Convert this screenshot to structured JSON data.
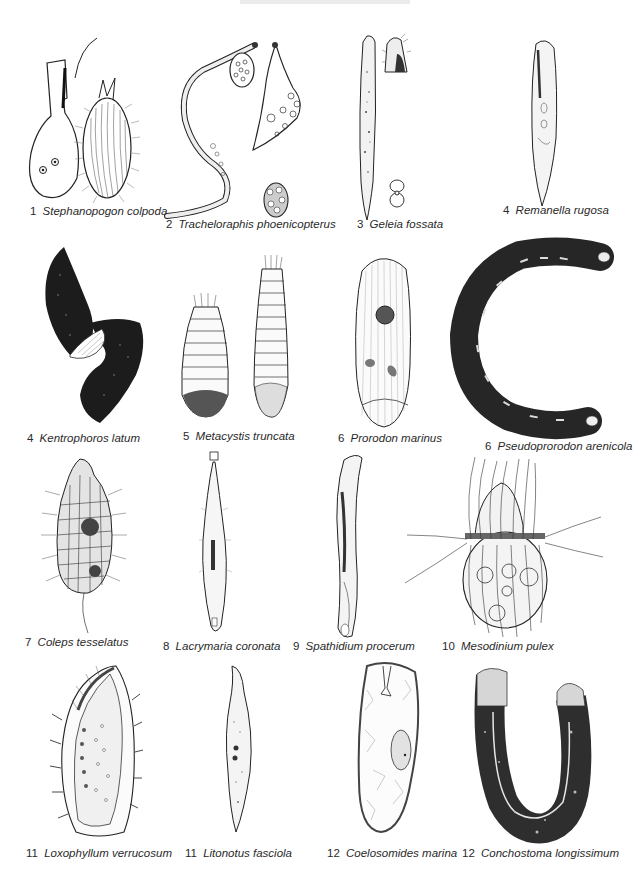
{
  "plate": {
    "background": "#ffffff",
    "ink_color": "#1e1e1e",
    "rows": [
      {
        "figures": [
          {
            "id": "stephanopogon",
            "number": "1",
            "name": "Stephanopogon colpoda"
          },
          {
            "id": "trachelophraphis",
            "number": "2",
            "name": "Tracheloraphis phoenicopterus"
          },
          {
            "id": "geleia",
            "number": "3",
            "name": "Geleia fossata"
          },
          {
            "id": "remanella",
            "number": "4",
            "name": "Remanella rugosa"
          }
        ]
      },
      {
        "figures": [
          {
            "id": "kentrophoros",
            "number": "4",
            "name": "Kentrophoros latum"
          },
          {
            "id": "metacystis",
            "number": "5",
            "name": "Metacystis truncata"
          },
          {
            "id": "prorodon",
            "number": "6",
            "name": "Prorodon marinus"
          },
          {
            "id": "pseudoprorodon",
            "number": "6",
            "name": "Pseudoprorodon arenicola"
          }
        ]
      },
      {
        "figures": [
          {
            "id": "coleps",
            "number": "7",
            "name": "Coleps tesselatus"
          },
          {
            "id": "lacrymaria",
            "number": "8",
            "name": "Lacrymaria coronata"
          },
          {
            "id": "spathidium",
            "number": "9",
            "name": "Spathidium procerum"
          },
          {
            "id": "mesodinium",
            "number": "10",
            "name": "Mesodinium pulex"
          }
        ]
      },
      {
        "figures": [
          {
            "id": "loxophyllum",
            "number": "11",
            "name": "Loxophyllum verrucosum"
          },
          {
            "id": "litonotus",
            "number": "11",
            "name": "Litonotus fasciola"
          },
          {
            "id": "coelosomides",
            "number": "12",
            "name": "Coelosomides marina"
          },
          {
            "id": "conchostoma",
            "number": "12",
            "name": "Conchostoma longissimum"
          }
        ]
      }
    ]
  }
}
